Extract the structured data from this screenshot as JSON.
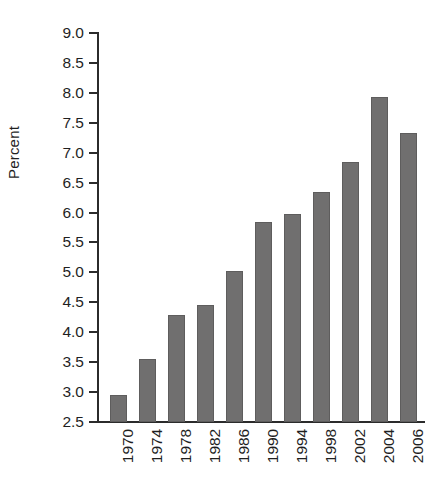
{
  "chart_data": {
    "type": "bar",
    "title": "",
    "subtitle": "",
    "xlabel": "",
    "ylabel": "Percent",
    "categories": [
      "1970",
      "1974",
      "1978",
      "1982",
      "1986",
      "1990",
      "1994",
      "1998",
      "2002",
      "2004",
      "2006"
    ],
    "values": [
      2.95,
      3.55,
      4.28,
      4.45,
      5.02,
      5.85,
      5.97,
      6.35,
      6.85,
      7.93,
      7.33
    ],
    "series": [
      {
        "name": "Percent",
        "values": [
          2.95,
          3.55,
          4.28,
          4.45,
          5.02,
          5.85,
          5.97,
          6.35,
          6.85,
          7.93,
          7.33
        ]
      }
    ],
    "ylim": [
      2.5,
      9.0
    ],
    "ytick_step": 0.5,
    "yticks": [
      "9.0",
      "8.5",
      "8.0",
      "7.5",
      "7.0",
      "6.5",
      "6.0",
      "5.5",
      "5.0",
      "4.5",
      "4.0",
      "3.5",
      "3.0",
      "2.5"
    ],
    "ytick_values": [
      9.0,
      8.5,
      8.0,
      7.5,
      7.0,
      6.5,
      6.0,
      5.5,
      5.0,
      4.5,
      4.0,
      3.5,
      3.0,
      2.5
    ],
    "grid": false,
    "legend": false,
    "legend_position": "none",
    "xtick_rotation": 90,
    "annotations": [],
    "colors": {
      "bar_fill": "#706f6f",
      "bar_stroke": "#5e5d5d",
      "axis": "#2b2b2b",
      "text": "#1f1f1f",
      "background": "#ffffff"
    }
  }
}
